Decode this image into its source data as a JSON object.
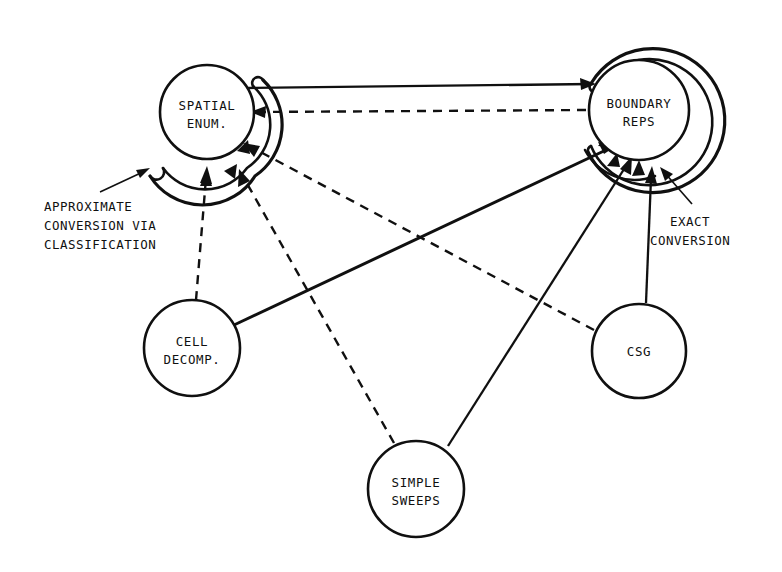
{
  "diagram": {
    "background_color": "#ffffff",
    "ink_color": "#101010",
    "nodes": [
      {
        "id": "spatial-enum",
        "label_line1": "SPATIAL",
        "label_line2": "ENUM.",
        "cx": 207,
        "cy": 112,
        "r": 47
      },
      {
        "id": "boundary-reps",
        "label_line1": "BOUNDARY",
        "label_line2": "REPS",
        "cx": 639,
        "cy": 110,
        "r": 50
      },
      {
        "id": "cell-decomp",
        "label_line1": "CELL",
        "label_line2": "DECOMP.",
        "cx": 192,
        "cy": 348,
        "r": 48
      },
      {
        "id": "simple-sweeps",
        "label_line1": "SIMPLE",
        "label_line2": "SWEEPS",
        "cx": 416,
        "cy": 489,
        "r": 48
      },
      {
        "id": "csg",
        "label_line1": "CSG",
        "label_line2": "",
        "cx": 639,
        "cy": 351,
        "r": 47
      }
    ],
    "annotations": [
      {
        "id": "approximate-conversion",
        "lines": [
          "APPROXIMATE",
          "CONVERSION VIA",
          "CLASSIFICATION"
        ],
        "x": 44,
        "y": 206
      },
      {
        "id": "exact-conversion",
        "lines": [
          "EXACT",
          "CONVERSION"
        ],
        "x": 655,
        "y": 221
      }
    ],
    "edges": [
      {
        "id": "spatial-enum-to-boundary-reps",
        "from": "spatial-enum",
        "to": "boundary-reps",
        "style": "solid",
        "meaning": "approximate conversion (enumeration to boundary)"
      },
      {
        "id": "boundary-reps-to-spatial-enum",
        "from": "boundary-reps",
        "to": "spatial-enum",
        "style": "dashed",
        "meaning": "approximate conversion via classification"
      },
      {
        "id": "cell-decomp-to-spatial-enum",
        "from": "cell-decomp",
        "to": "spatial-enum",
        "style": "dashed",
        "meaning": "approximate conversion via classification"
      },
      {
        "id": "cell-decomp-to-boundary-reps",
        "from": "cell-decomp",
        "to": "boundary-reps",
        "style": "solid",
        "meaning": "exact conversion"
      },
      {
        "id": "simple-sweeps-to-spatial-enum",
        "from": "simple-sweeps",
        "to": "spatial-enum",
        "style": "dashed",
        "meaning": "approximate conversion via classification"
      },
      {
        "id": "simple-sweeps-to-boundary-reps",
        "from": "simple-sweeps",
        "to": "boundary-reps",
        "style": "solid",
        "meaning": "exact conversion"
      },
      {
        "id": "csg-to-spatial-enum",
        "from": "csg",
        "to": "spatial-enum",
        "style": "dashed",
        "meaning": "approximate conversion via classification"
      },
      {
        "id": "csg-to-boundary-reps",
        "from": "csg",
        "to": "boundary-reps",
        "style": "solid",
        "meaning": "exact conversion"
      }
    ],
    "legend": {
      "solid_meaning": "EXACT CONVERSION",
      "dashed_meaning": "APPROXIMATE CONVERSION VIA CLASSIFICATION"
    }
  }
}
